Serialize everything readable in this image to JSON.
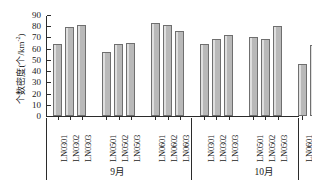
{
  "chart_data": {
    "type": "bar",
    "title": "",
    "xlabel": "",
    "ylabel": "个数密度(个/km<sup>-2</sup>)",
    "ylabel_text": "个数密度(个/km-2)",
    "ylim": [
      0,
      90
    ],
    "ytick_step": 10,
    "yticks": [
      "90",
      "80",
      "70",
      "60",
      "50",
      "40",
      "30",
      "20",
      "10",
      "0"
    ],
    "grid": false,
    "legend": null,
    "bar_color": "#b9b9b9",
    "bar_border_color": "#6f6f6f",
    "axis_color": "#2b2b2b",
    "categories": [
      "LN0301",
      "LN0302",
      "LN0303",
      "LN0501",
      "LN0502",
      "LN0503",
      "LN0601",
      "LN0602",
      "LN0603",
      "LN0301",
      "LN0302",
      "LN0303",
      "LN0501",
      "LN0502",
      "LN0503",
      "LN0601",
      "LN0602",
      "LN0603"
    ],
    "values": [
      64,
      79,
      81,
      57,
      64,
      65,
      83,
      81,
      76,
      64,
      69,
      72,
      70,
      69,
      80,
      46,
      63,
      62
    ],
    "group_labels": [
      "9月",
      "10月"
    ],
    "groups": [
      {
        "label": "9月",
        "subgroups": [
          {
            "categories": [
              "LN0301",
              "LN0302",
              "LN0303"
            ],
            "values": [
              64,
              79,
              81
            ]
          },
          {
            "categories": [
              "LN0501",
              "LN0502",
              "LN0503"
            ],
            "values": [
              57,
              64,
              65
            ]
          },
          {
            "categories": [
              "LN0601",
              "LN0602",
              "LN0603"
            ],
            "values": [
              83,
              81,
              76
            ]
          }
        ]
      },
      {
        "label": "10月",
        "subgroups": [
          {
            "categories": [
              "LN0301",
              "LN0302",
              "LN0303"
            ],
            "values": [
              64,
              69,
              72
            ]
          },
          {
            "categories": [
              "LN0501",
              "LN0502",
              "LN0503"
            ],
            "values": [
              70,
              69,
              80
            ]
          },
          {
            "categories": [
              "LN0601",
              "LN0602",
              "LN0603"
            ],
            "values": [
              46,
              63,
              62
            ]
          }
        ]
      }
    ]
  },
  "axis": {
    "y_title_main": "个数密度(个/km",
    "y_title_sup": "-2",
    "y_title_close": ")"
  }
}
